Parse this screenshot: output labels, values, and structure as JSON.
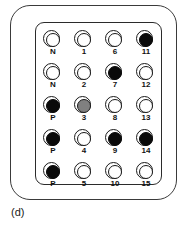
{
  "figure": {
    "caption": "(d)",
    "colors": {
      "filled": "#0a0a0a",
      "partial": "#808080",
      "empty": "#ffffff",
      "outline": "#1a1a1a",
      "case_outline": "#3a3a3a"
    },
    "plate": {
      "rows": 5,
      "columns": 4,
      "wells": [
        {
          "label": "N",
          "state": "empty",
          "row": 1,
          "col": 1
        },
        {
          "label": "1",
          "state": "empty",
          "row": 1,
          "col": 2
        },
        {
          "label": "6",
          "state": "empty",
          "row": 1,
          "col": 3
        },
        {
          "label": "11",
          "state": "filled",
          "row": 1,
          "col": 4
        },
        {
          "label": "N",
          "state": "empty",
          "row": 2,
          "col": 1
        },
        {
          "label": "2",
          "state": "empty",
          "row": 2,
          "col": 2
        },
        {
          "label": "7",
          "state": "filled",
          "row": 2,
          "col": 3
        },
        {
          "label": "12",
          "state": "empty",
          "row": 2,
          "col": 4
        },
        {
          "label": "P",
          "state": "filled",
          "row": 3,
          "col": 1
        },
        {
          "label": "3",
          "state": "partial",
          "row": 3,
          "col": 2
        },
        {
          "label": "8",
          "state": "empty",
          "row": 3,
          "col": 3
        },
        {
          "label": "13",
          "state": "empty",
          "row": 3,
          "col": 4
        },
        {
          "label": "P",
          "state": "filled",
          "row": 4,
          "col": 1
        },
        {
          "label": "4",
          "state": "empty",
          "row": 4,
          "col": 2
        },
        {
          "label": "9",
          "state": "filled",
          "row": 4,
          "col": 3
        },
        {
          "label": "14",
          "state": "filled",
          "row": 4,
          "col": 4
        },
        {
          "label": "P",
          "state": "filled",
          "row": 5,
          "col": 1
        },
        {
          "label": "5",
          "state": "empty",
          "row": 5,
          "col": 2
        },
        {
          "label": "10",
          "state": "empty",
          "row": 5,
          "col": 3
        },
        {
          "label": "15",
          "state": "empty",
          "row": 5,
          "col": 4
        }
      ]
    }
  }
}
